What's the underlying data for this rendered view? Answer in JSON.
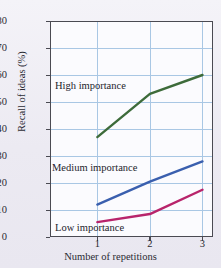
{
  "chart_data": {
    "type": "line",
    "title": "",
    "xlabel": "Number of repetitions",
    "ylabel": "Recall of ideas (%)",
    "x": [
      1,
      2,
      3
    ],
    "xtick_labels": [
      "1",
      "2",
      "3"
    ],
    "ytick_labels": [
      "0",
      "10",
      "20",
      "30",
      "40",
      "50",
      "60",
      "70",
      "80"
    ],
    "ylim": [
      0,
      80
    ],
    "xlim": [
      0.1,
      3.2
    ],
    "grid": true,
    "legend_position": "inline-annotations",
    "series": [
      {
        "name": "High importance",
        "label": "High importance",
        "color": "#3d6b3a",
        "values": [
          37,
          53,
          60
        ]
      },
      {
        "name": "Medium importance",
        "label": "Medium importance",
        "color": "#3a5fae",
        "values": [
          12,
          20.5,
          28
        ]
      },
      {
        "name": "Low importance",
        "label": "Low importance",
        "color": "#b8246b",
        "values": [
          5.5,
          8.5,
          17.5
        ]
      }
    ]
  },
  "colors": {
    "high": "#3d6b3a",
    "medium": "#3a5fae",
    "low": "#b8246b",
    "grid": "#a9c7e4",
    "frame": "#4a4a52",
    "plot_background": "#fbfbfe",
    "figure_background": "#efeef4"
  }
}
